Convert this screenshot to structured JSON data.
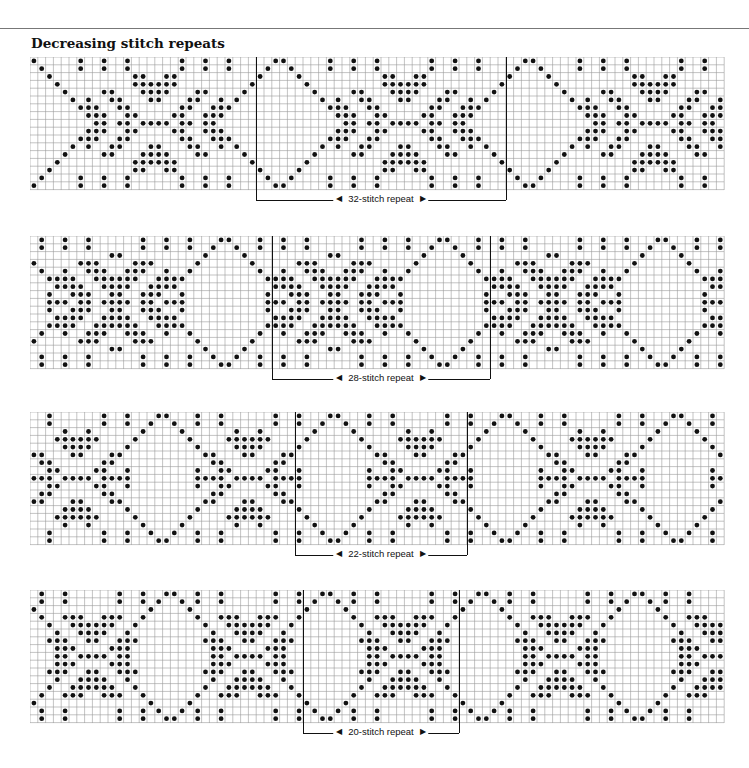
{
  "page": {
    "title": "Decreasing stitch repeats"
  },
  "charts": [
    {
      "name": "chart-32",
      "top": 57,
      "rows": 17,
      "repeat": 32,
      "label": "32-stitch repeat",
      "repeat_start_col": 29,
      "offset": 0
    },
    {
      "name": "chart-28",
      "top": 236,
      "rows": 17,
      "repeat": 28,
      "label": "28-stitch repeat",
      "repeat_start_col": 31,
      "offset": 3
    },
    {
      "name": "chart-22",
      "top": 412,
      "rows": 17,
      "repeat": 22,
      "label": "22-stitch repeat",
      "repeat_start_col": 34,
      "offset": 5
    },
    {
      "name": "chart-20",
      "top": 590,
      "rows": 17,
      "repeat": 20,
      "label": "20-stitch repeat",
      "repeat_start_col": 35,
      "offset": 2
    }
  ],
  "grid": {
    "cols": 89,
    "cell": 7.8,
    "line_color": "#9a9a9a",
    "dot_color": "#111111"
  }
}
